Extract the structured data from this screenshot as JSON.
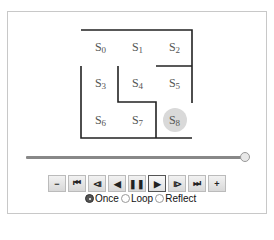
{
  "maze": {
    "cells": [
      {
        "id": "s0",
        "label": "S",
        "sub": "0",
        "x": 82,
        "y": 40
      },
      {
        "id": "s1",
        "label": "S",
        "sub": "1",
        "x": 119,
        "y": 40
      },
      {
        "id": "s2",
        "label": "S",
        "sub": "2",
        "x": 156,
        "y": 40
      },
      {
        "id": "s3",
        "label": "S",
        "sub": "3",
        "x": 82,
        "y": 76
      },
      {
        "id": "s4",
        "label": "S",
        "sub": "4",
        "x": 119,
        "y": 76
      },
      {
        "id": "s5",
        "label": "S",
        "sub": "5",
        "x": 156,
        "y": 76
      },
      {
        "id": "s6",
        "label": "S",
        "sub": "6",
        "x": 82,
        "y": 113
      },
      {
        "id": "s7",
        "label": "S",
        "sub": "7",
        "x": 119,
        "y": 113
      },
      {
        "id": "s8",
        "label": "S",
        "sub": "8",
        "x": 156,
        "y": 113
      }
    ],
    "current_state": "s8",
    "agent_color": "#d9d9d9",
    "wall_color": "#222222"
  },
  "slider": {
    "value": 100,
    "min": 0,
    "max": 100
  },
  "controls": [
    {
      "id": "slower",
      "glyph": "−",
      "name": "slower-button"
    },
    {
      "id": "first",
      "glyph": "⏮",
      "name": "first-frame-button"
    },
    {
      "id": "prev",
      "glyph": "⧏",
      "name": "previous-frame-button"
    },
    {
      "id": "reverse",
      "glyph": "◀",
      "name": "play-reverse-button"
    },
    {
      "id": "pause",
      "glyph": "❚❚",
      "name": "pause-button"
    },
    {
      "id": "play",
      "glyph": "▶",
      "name": "play-button",
      "active": true
    },
    {
      "id": "next",
      "glyph": "⧐",
      "name": "next-frame-button"
    },
    {
      "id": "last",
      "glyph": "⏭",
      "name": "last-frame-button"
    },
    {
      "id": "faster",
      "glyph": "+",
      "name": "faster-button"
    }
  ],
  "loop_mode": {
    "options": [
      "Once",
      "Loop",
      "Reflect"
    ],
    "selected": "Once"
  }
}
